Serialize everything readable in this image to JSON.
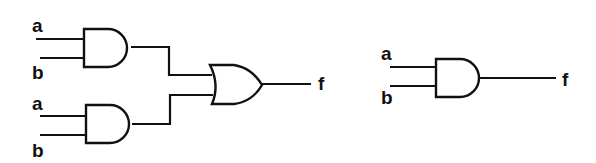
{
  "diagram": {
    "left_circuit": {
      "description": "Two AND gates feeding an OR gate",
      "gate1_inputs": [
        "a",
        "b"
      ],
      "gate2_inputs": [
        "a",
        "b"
      ],
      "output": "f"
    },
    "right_circuit": {
      "description": "Single AND gate",
      "inputs": [
        "a",
        "b"
      ],
      "output": "f"
    }
  }
}
